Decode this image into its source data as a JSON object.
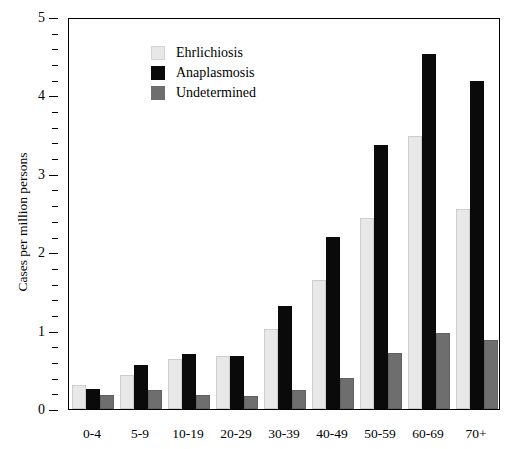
{
  "chart_data": {
    "type": "bar",
    "title": "",
    "xlabel": "",
    "ylabel": "Cases per million persons",
    "ylim": [
      0,
      5
    ],
    "yticks": [
      0,
      1,
      2,
      3,
      4,
      5
    ],
    "ytick_labels": [
      "0",
      "1",
      "2",
      "3",
      "4",
      "5"
    ],
    "y_minor_tick_step": 0.2,
    "grid": false,
    "legend_position": "top-left",
    "categories": [
      "0-4",
      "5-9",
      "10-19",
      "20-29",
      "30-39",
      "40-49",
      "50-59",
      "60-69",
      "70+"
    ],
    "series": [
      {
        "name": "Ehrlichiosis",
        "color": "#e8e8e8",
        "values": [
          0.31,
          0.43,
          0.64,
          0.68,
          1.02,
          1.65,
          2.44,
          3.48,
          2.55
        ]
      },
      {
        "name": "Anaplasmosis",
        "color": "#0a0a0a",
        "values": [
          0.25,
          0.56,
          0.7,
          0.67,
          1.31,
          2.19,
          3.37,
          4.53,
          4.19
        ]
      },
      {
        "name": "Undetermined",
        "color": "#6e6e6e",
        "values": [
          0.18,
          0.24,
          0.18,
          0.17,
          0.24,
          0.39,
          0.72,
          0.97,
          0.88
        ]
      }
    ]
  },
  "legend": {
    "items": [
      {
        "label": "Ehrlichiosis",
        "swatch": "ehrlichiosis"
      },
      {
        "label": "Anaplasmosis",
        "swatch": "anaplasmosis"
      },
      {
        "label": "Undetermined",
        "swatch": "undetermined"
      }
    ]
  },
  "axes": {
    "y_title": "Cases per million persons"
  }
}
